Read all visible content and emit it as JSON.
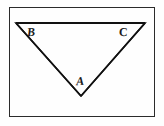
{
  "figure": {
    "background_color": "#fefefe",
    "frame": {
      "stroke_color": "#2b2b2b",
      "stroke_width": 1,
      "x": 9,
      "y": 7,
      "width": 146,
      "height": 110
    },
    "triangle": {
      "stroke_color": "#111111",
      "stroke_width": 1.6,
      "orientation": "point-down",
      "vertices": [
        {
          "name": "B",
          "role": "top-left",
          "x": 16,
          "y": 23
        },
        {
          "name": "C",
          "role": "top-right",
          "x": 145,
          "y": 23
        },
        {
          "name": "A",
          "role": "bottom-apex",
          "x": 81,
          "y": 96
        }
      ]
    },
    "labels": [
      {
        "id": "B",
        "text": "B",
        "x": 27,
        "y": 26
      },
      {
        "id": "C",
        "text": "C",
        "x": 119,
        "y": 26
      },
      {
        "id": "A",
        "text": "A",
        "x": 76,
        "y": 75
      }
    ]
  }
}
